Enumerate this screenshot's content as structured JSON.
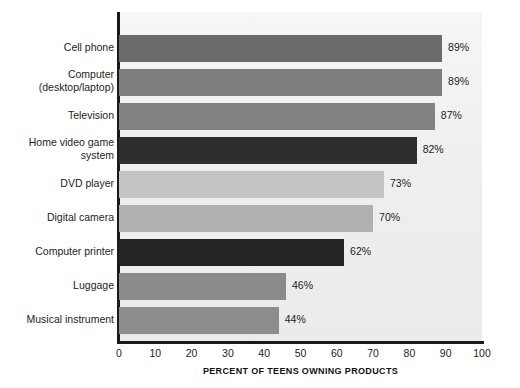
{
  "chart_data": {
    "type": "bar",
    "orientation": "horizontal",
    "title": "",
    "xlabel": "PERCENT OF TEENS OWNING PRODUCTS",
    "ylabel": "",
    "xlim": [
      0,
      100
    ],
    "xticks": [
      "0",
      "10",
      "20",
      "30",
      "40",
      "50",
      "60",
      "70",
      "80",
      "90",
      "100"
    ],
    "grid": false,
    "legend": null,
    "value_suffix": "%",
    "categories": [
      "Cell phone",
      "Computer\n(desktop/laptop)",
      "Television",
      "Home video game\nsystem",
      "DVD player",
      "Digital camera",
      "Computer printer",
      "Luggage",
      "Musical instrument"
    ],
    "values": [
      89,
      89,
      87,
      82,
      73,
      70,
      62,
      46,
      44
    ],
    "value_labels": [
      "89%",
      "89%",
      "87%",
      "82%",
      "73%",
      "70%",
      "62%",
      "46%",
      "44%"
    ],
    "bar_colors": [
      "#6b6b6b",
      "#7d7d7d",
      "#828282",
      "#2e2e2e",
      "#c4c4c4",
      "#b0b0b0",
      "#242424",
      "#8a8a8a",
      "#8d8d8d"
    ],
    "plot_background": "#f0f0f0",
    "axis_color": "#1a1a1a"
  }
}
